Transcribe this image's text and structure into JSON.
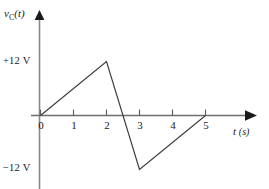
{
  "figure": {
    "name": "capacitor-voltage-waveform",
    "background_color": "#ffffff",
    "line_color": "#3a3a3a",
    "axis_color": "#6e6e6e",
    "text_color": "#1a1a1a"
  },
  "axes": {
    "y_axis": {
      "label_main": "v",
      "label_sub": "C",
      "label_paren": "(t)",
      "label_full": "v_C(t)",
      "has_arrow": true
    },
    "x_axis": {
      "label_var": "t ",
      "label_unit": "(s)",
      "label_full": "t (s)",
      "has_arrow": true
    }
  },
  "value_labels": {
    "positive_peak": "+12 V",
    "negative_peak": "−12 V"
  },
  "ticks": {
    "x": [
      "0",
      "1",
      "2",
      "3",
      "4",
      "5"
    ]
  },
  "chart_data": {
    "type": "line",
    "title": "",
    "xlabel": "t (s)",
    "ylabel": "v_C(t)",
    "xlim": [
      0,
      5.6
    ],
    "ylim": [
      -14,
      14
    ],
    "grid": false,
    "legend": "none",
    "x_ticks": [
      0,
      1,
      2,
      3,
      4,
      5
    ],
    "x_tick_labels": [
      "0",
      "1",
      "2",
      "3",
      "4",
      "5"
    ],
    "y_ticks": [
      -12,
      12
    ],
    "y_tick_labels": [
      "−12 V",
      "+12 V"
    ],
    "series": [
      {
        "name": "v_C(t)",
        "x": [
          0,
          2,
          3,
          5
        ],
        "values": [
          0,
          12,
          -12,
          0
        ],
        "zero_crossings": [
          0,
          2.5,
          5
        ]
      }
    ]
  }
}
